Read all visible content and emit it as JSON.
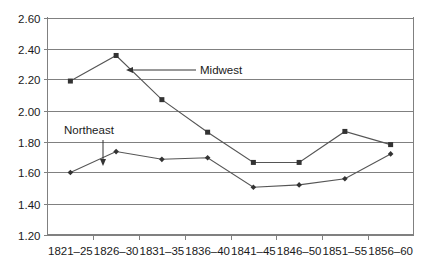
{
  "chart_data": {
    "type": "line",
    "title": "",
    "xlabel": "",
    "ylabel": "",
    "categories": [
      "1821–25",
      "1826–30",
      "1831–35",
      "1836–40",
      "1841–45",
      "1846–50",
      "1851–55",
      "1856–60"
    ],
    "ylim": [
      1.2,
      2.6
    ],
    "ytick_labels": [
      "2.60",
      "2.40",
      "2.20",
      "2.00",
      "1.80",
      "1.60",
      "1.40",
      "1.20"
    ],
    "ytick_values": [
      2.6,
      2.4,
      2.2,
      2.0,
      1.8,
      1.6,
      1.4,
      1.2
    ],
    "grid": "horizontal",
    "legend": "none",
    "series": [
      {
        "name": "Midwest",
        "marker": "square",
        "color": "#555555",
        "values": [
          2.19,
          2.355,
          2.07,
          1.86,
          1.665,
          1.665,
          1.865,
          1.78
        ]
      },
      {
        "name": "Northeast",
        "marker": "diamond",
        "color": "#555555",
        "values": [
          1.6,
          1.735,
          1.685,
          1.695,
          1.505,
          1.52,
          1.56,
          1.72
        ]
      }
    ],
    "annotations": [
      {
        "text": "Midwest",
        "target_series": "Midwest",
        "target_category": "1831–35",
        "arrow": "left"
      },
      {
        "text": "Northeast",
        "target_series": "Northeast",
        "target_category": "1826–30",
        "arrow": "down"
      }
    ]
  }
}
